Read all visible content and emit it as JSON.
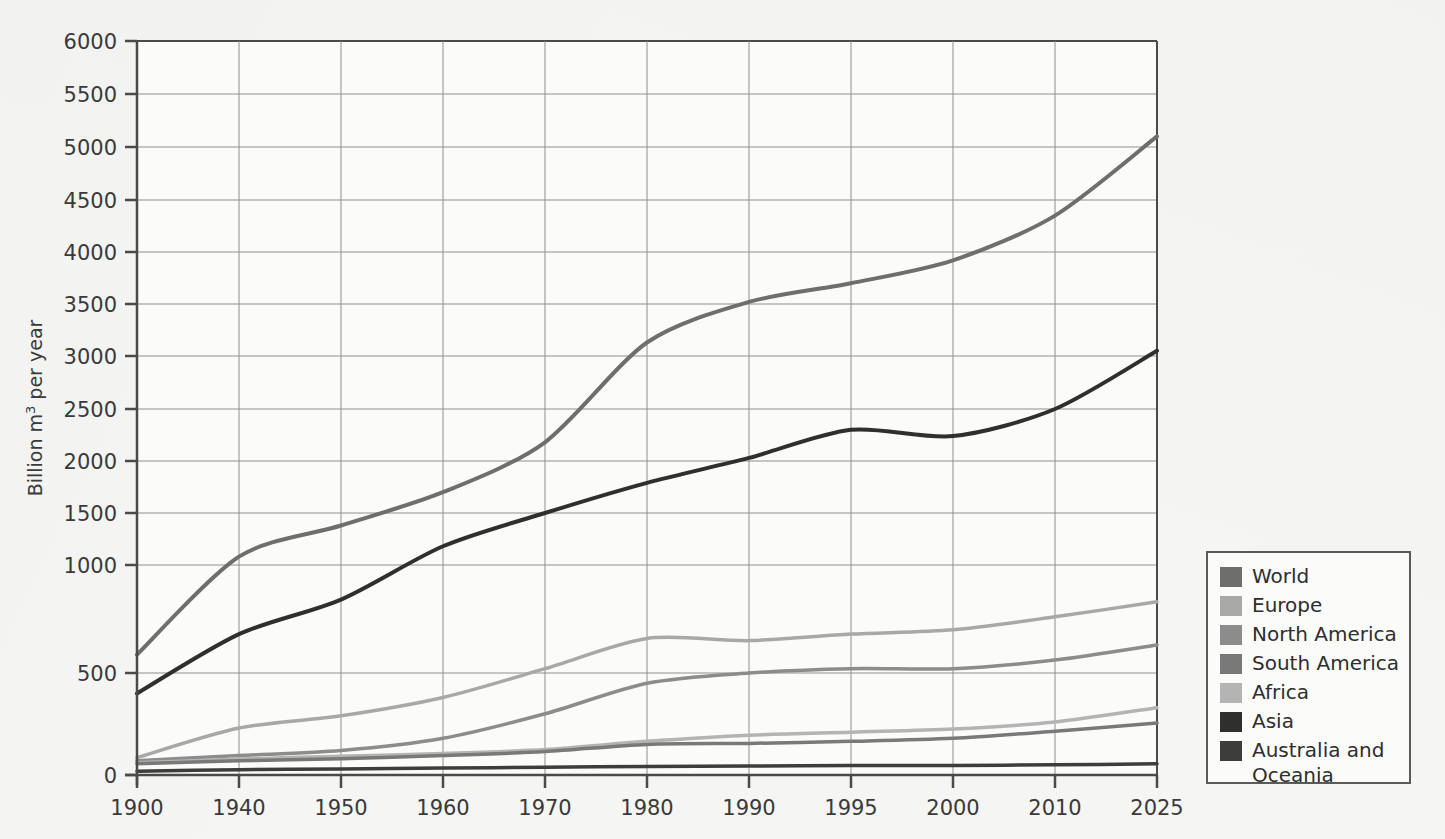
{
  "chart_data": {
    "type": "line",
    "title": "",
    "xlabel": "",
    "ylabel": "Billion m³ per year",
    "grid": true,
    "legend_position": "right",
    "x_axis_type": "categorical-uneven-years",
    "categories": [
      "1900",
      "1940",
      "1950",
      "1960",
      "1970",
      "1980",
      "1990",
      "1995",
      "2000",
      "2010",
      "2025"
    ],
    "y_ticks": [
      "0",
      "500",
      "1000",
      "1500",
      "2000",
      "2500",
      "3000",
      "3500",
      "4000",
      "4500",
      "5000",
      "5500",
      "6000"
    ],
    "ylim": [
      0,
      6000
    ],
    "y_axis_note": "tick spacing is non-uniform below 1000",
    "series": [
      {
        "name": "World",
        "color": "#6e6e6e",
        "values": [
          585,
          1080,
          1380,
          1700,
          2180,
          3130,
          3520,
          3700,
          3920,
          4350,
          5100
        ]
      },
      {
        "name": "Europe",
        "color": "#a8a8a8",
        "values": [
          85,
          230,
          290,
          380,
          520,
          660,
          650,
          680,
          700,
          760,
          830
        ]
      },
      {
        "name": " North America",
        "color": "#8c8c8c",
        "values": [
          70,
          95,
          120,
          180,
          300,
          450,
          500,
          520,
          520,
          560,
          630
        ]
      },
      {
        "name": " South America",
        "color": "#797979",
        "values": [
          55,
          70,
          80,
          95,
          115,
          150,
          155,
          165,
          180,
          215,
          255
        ]
      },
      {
        "name": "Africa",
        "color": "#b4b4b4",
        "values": [
          60,
          78,
          92,
          105,
          125,
          165,
          195,
          210,
          225,
          260,
          330
        ]
      },
      {
        "name": "Asia",
        "color": "#2f2f2f",
        "values": [
          400,
          680,
          840,
          1180,
          1500,
          1790,
          2030,
          2300,
          2240,
          2500,
          3050
        ]
      },
      {
        "name": "Australia and\nOceania",
        "color": "#3d3d3d",
        "values": [
          18,
          26,
          30,
          34,
          38,
          42,
          44,
          46,
          47,
          50,
          55
        ]
      }
    ]
  },
  "legend": {
    "items": [
      {
        "label": "World",
        "color": "#6e6e6e"
      },
      {
        "label": "Europe",
        "color": "#a8a8a8"
      },
      {
        "label": " North America",
        "color": "#8c8c8c"
      },
      {
        "label": " South America",
        "color": "#797979"
      },
      {
        "label": "Africa",
        "color": "#b4b4b4"
      },
      {
        "label": "Asia",
        "color": "#2f2f2f"
      },
      {
        "label": "Australia and\nOceania",
        "color": "#3d3d3d"
      }
    ]
  },
  "colors": {
    "background": "#f5f5f3",
    "axis": "#4a4a4a",
    "grid": "#8f8f8f",
    "text": "#3a3a3a"
  }
}
